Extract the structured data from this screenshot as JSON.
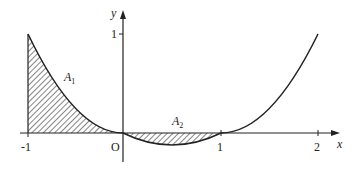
{
  "diagram": {
    "function": "y = (x^2 - x) / 2",
    "x_axis": {
      "label": "x",
      "ticks": [
        "-1",
        "1",
        "2"
      ]
    },
    "y_axis": {
      "label": "y",
      "ticks": [
        "1"
      ]
    },
    "origin_label": "O",
    "regions": [
      {
        "name": "A1",
        "label": "A",
        "subscript": "1",
        "from": -1,
        "to": 0,
        "side": "above x-axis"
      },
      {
        "name": "A2",
        "label": "A",
        "subscript": "2",
        "from": 0,
        "to": 1,
        "side": "below x-axis"
      }
    ],
    "colors": {
      "stroke": "#222222",
      "background": "#ffffff"
    }
  }
}
